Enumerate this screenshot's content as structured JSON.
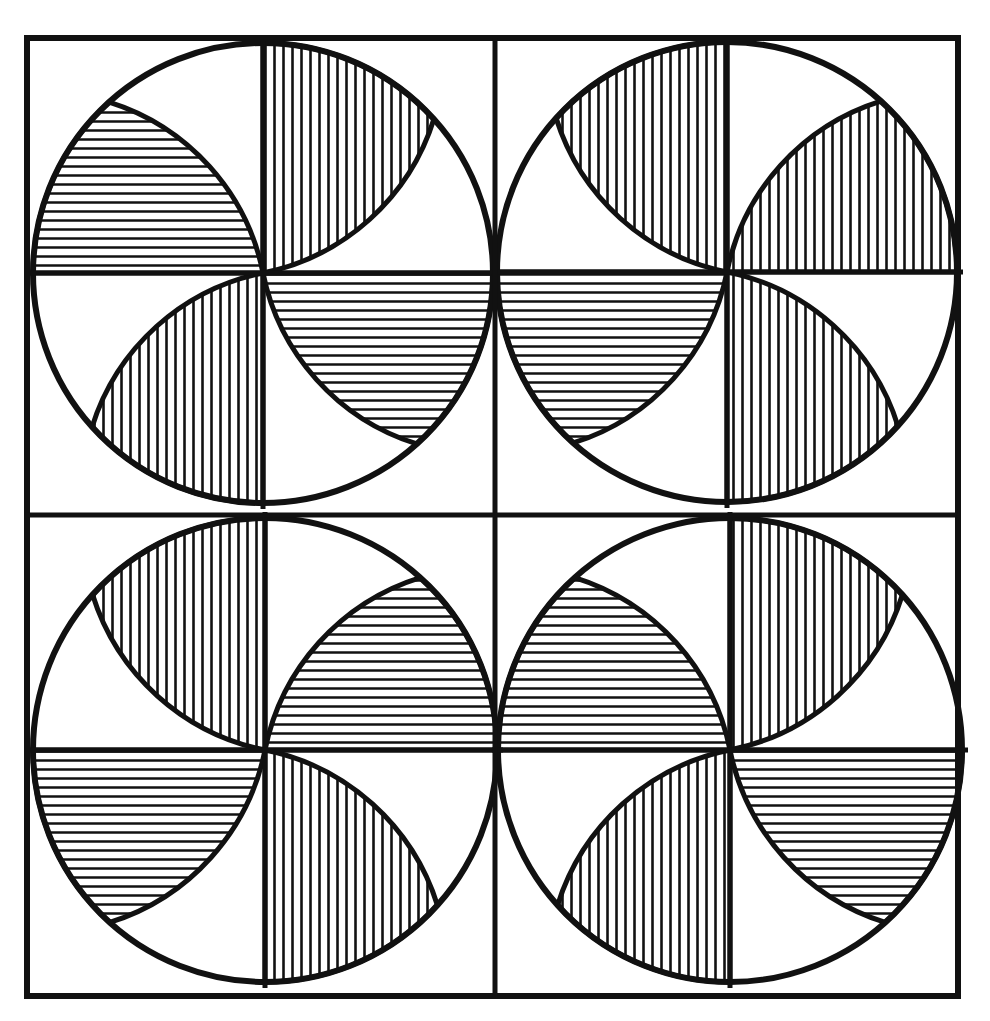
{
  "artwork": {
    "description": "Black-and-white hatched pinwheel quilt pattern: 2x2 grid of squares each containing a circle with four hatched petals",
    "ink_color": "#111111",
    "paper_color": "#ffffff",
    "frame": {
      "x1": 27,
      "y1": 38,
      "x2": 958,
      "y2": 996,
      "mid_x": 495,
      "mid_y": 515
    },
    "blocks": [
      {
        "name": "top-left",
        "cx": 263,
        "cy": 273,
        "r": 230,
        "dir": "cw",
        "petals": [
          {
            "base": 180,
            "hatch": "h"
          },
          {
            "base": 270,
            "hatch": "v"
          },
          {
            "base": 0,
            "hatch": "h"
          },
          {
            "base": 90,
            "hatch": "v"
          }
        ]
      },
      {
        "name": "top-right",
        "cx": 727,
        "cy": 272,
        "r": 230,
        "dir": "ccw",
        "petals": [
          {
            "base": 270,
            "hatch": "v"
          },
          {
            "base": 0,
            "hatch": "v"
          },
          {
            "base": 90,
            "hatch": "v"
          },
          {
            "base": 180,
            "hatch": "h"
          }
        ]
      },
      {
        "name": "bottom-left",
        "cx": 265,
        "cy": 750,
        "r": 232,
        "dir": "ccw",
        "petals": [
          {
            "base": 270,
            "hatch": "v"
          },
          {
            "base": 0,
            "hatch": "h"
          },
          {
            "base": 90,
            "hatch": "v"
          },
          {
            "base": 180,
            "hatch": "h"
          }
        ]
      },
      {
        "name": "bottom-right",
        "cx": 730,
        "cy": 750,
        "r": 232,
        "dir": "cw",
        "petals": [
          {
            "base": 180,
            "hatch": "h"
          },
          {
            "base": 270,
            "hatch": "v"
          },
          {
            "base": 0,
            "hatch": "h"
          },
          {
            "base": 90,
            "hatch": "v"
          }
        ]
      }
    ],
    "petal_sweep_deg": 48,
    "hatch_spacing": 9,
    "stroke_width": {
      "frame": 6,
      "circle": 6,
      "petal": 5,
      "hatch": 2.6
    }
  }
}
